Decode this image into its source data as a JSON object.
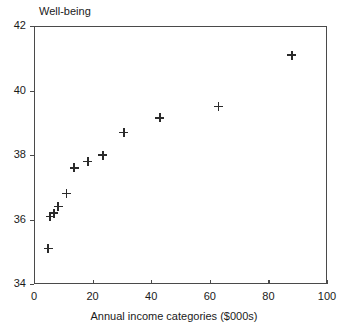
{
  "chart_data": {
    "type": "scatter",
    "title": "Well-being",
    "xlabel": "Annual income categories ($000s)",
    "ylabel": "",
    "xlim": [
      0,
      100
    ],
    "ylim": [
      34,
      42
    ],
    "xticks": [
      "0",
      "20",
      "40",
      "60",
      "80",
      "100"
    ],
    "yticks": [
      "34",
      "36",
      "38",
      "40",
      "42"
    ],
    "grid": false,
    "legend": null,
    "marker_style": "plus",
    "marker_color": "#2b2b2b",
    "points": [
      {
        "x": 4.8,
        "y": 35.1
      },
      {
        "x": 5.5,
        "y": 36.1
      },
      {
        "x": 6.8,
        "y": 36.2
      },
      {
        "x": 8.2,
        "y": 36.4
      },
      {
        "x": 11.0,
        "y": 36.8
      },
      {
        "x": 13.7,
        "y": 37.6
      },
      {
        "x": 18.4,
        "y": 37.8
      },
      {
        "x": 23.5,
        "y": 38.0
      },
      {
        "x": 30.7,
        "y": 38.7
      },
      {
        "x": 43.0,
        "y": 39.15
      },
      {
        "x": 63.0,
        "y": 39.5
      },
      {
        "x": 88.0,
        "y": 41.1
      }
    ]
  },
  "axes": {
    "frame_color": "#4a4a4a"
  }
}
